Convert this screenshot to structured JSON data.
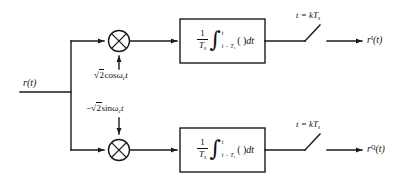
{
  "figure": {
    "type": "block-diagram",
    "stroke_color": "#1a1a1a",
    "background_color": "#ffffff"
  },
  "input": {
    "label": "r(t)",
    "label_base": "r",
    "label_arg": "(t)"
  },
  "branches": [
    {
      "id": "in-phase",
      "carrier": {
        "sign": "",
        "radical": "√",
        "coefficient": "2",
        "function": "cos",
        "omega": "ω",
        "omega_sub": "c",
        "time": "t",
        "full": "√2cosω_c t"
      },
      "mixer": {
        "symbol": "⊗",
        "name": "multiplier"
      },
      "integrator": {
        "numerator": "1",
        "denominator": "T",
        "denominator_sub": "s",
        "integral_symbol": "∫",
        "upper_limit": "t",
        "lower_limit": "t − T",
        "lower_limit_sub": "s",
        "operand": "(  )",
        "differential": "dt",
        "full": "1/T_s ∫_{t-T_s}^{t} (  )dt"
      },
      "sampler": {
        "label": "t = kT",
        "label_sub": "s",
        "full": "t = kT_s"
      },
      "output": {
        "base": "r",
        "superscript": "I",
        "arg": "(t)",
        "full": "r^I(t)"
      }
    },
    {
      "id": "quadrature",
      "carrier": {
        "sign": "−",
        "radical": "√",
        "coefficient": "2",
        "function": "sin",
        "omega": "ω",
        "omega_sub": "c",
        "time": "t",
        "full": "−√2sinω_c t"
      },
      "mixer": {
        "symbol": "⊗",
        "name": "multiplier"
      },
      "integrator": {
        "numerator": "1",
        "denominator": "T",
        "denominator_sub": "s",
        "integral_symbol": "∫",
        "upper_limit": "t",
        "lower_limit": "t − T",
        "lower_limit_sub": "s",
        "operand": "(  )",
        "differential": "dt",
        "full": "1/T_s ∫_{t-T_s}^{t} (  )dt"
      },
      "sampler": {
        "label": "t = kT",
        "label_sub": "s",
        "full": "t = kT_s"
      },
      "output": {
        "base": "r",
        "superscript": "Q",
        "arg": "(t)",
        "full": "r^Q(t)"
      }
    }
  ]
}
